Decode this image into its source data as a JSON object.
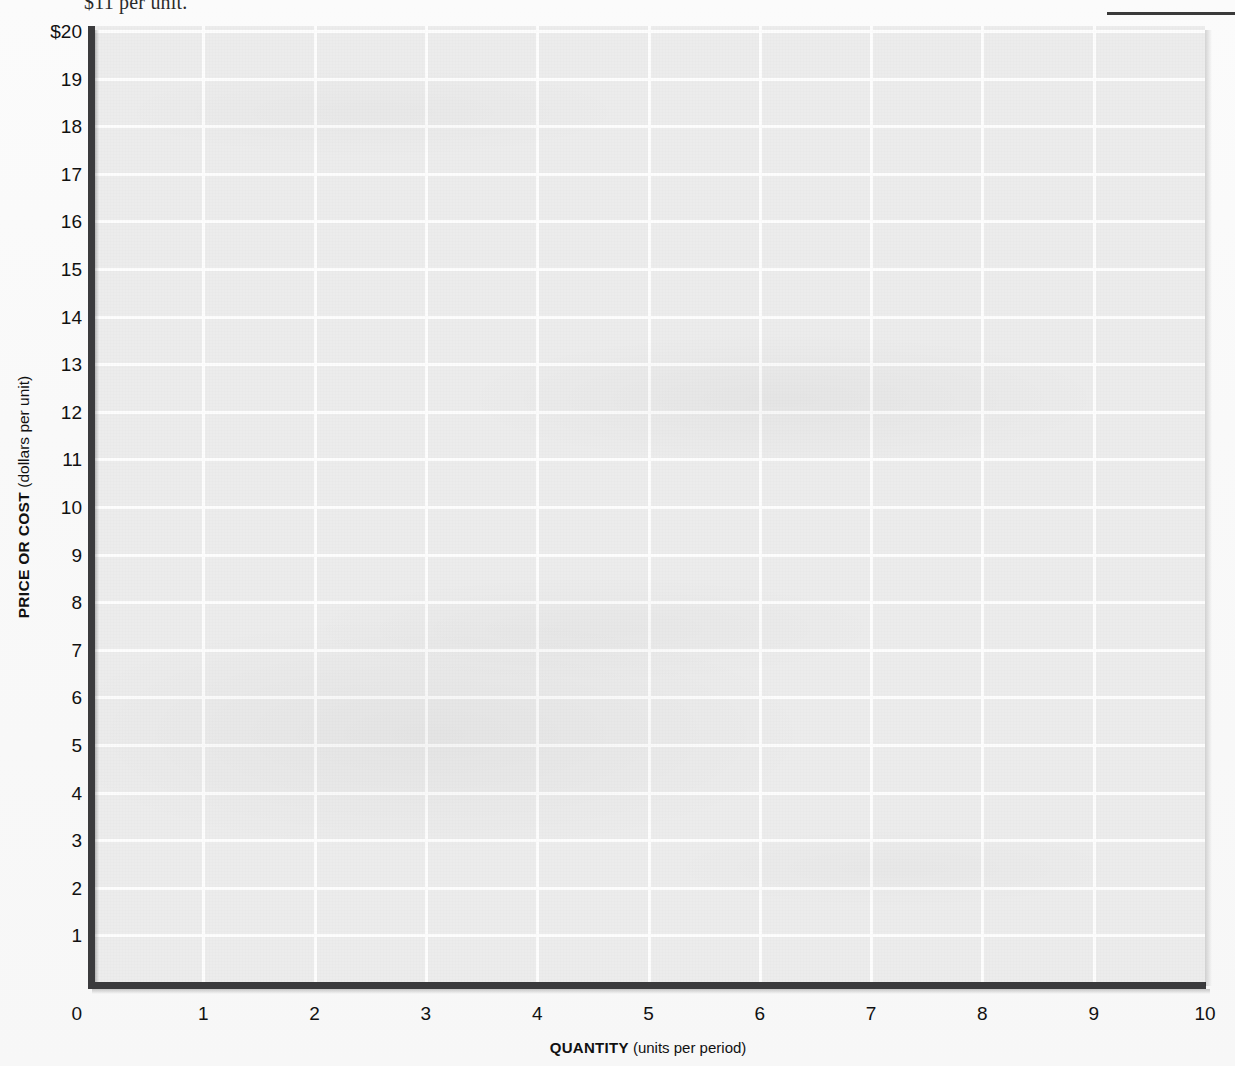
{
  "page": {
    "top_caption": "$11 per unit.",
    "top_rule": "horizontal-rule"
  },
  "chart_data": {
    "type": "line",
    "title": "",
    "subtitle": "",
    "xlabel_bold": "QUANTITY",
    "xlabel_light": "(units per period)",
    "ylabel_bold": "PRICE OR COST",
    "ylabel_light": "(dollars per unit)",
    "xlim": [
      0,
      10
    ],
    "ylim": [
      0,
      20
    ],
    "xticks": [
      "0",
      "1",
      "2",
      "3",
      "4",
      "5",
      "6",
      "7",
      "8",
      "9",
      "10"
    ],
    "yticks": [
      "$20",
      "19",
      "18",
      "17",
      "16",
      "15",
      "14",
      "13",
      "12",
      "11",
      "10",
      "9",
      "8",
      "7",
      "6",
      "5",
      "4",
      "3",
      "2",
      "1",
      "0"
    ],
    "grid": true,
    "legend": null,
    "series": [],
    "annotations": [],
    "note": "Blank worksheet grid — no data plotted",
    "colors": {
      "panel_fill": "#ececec",
      "gridline": "#fdfdfd",
      "axis": "#3b3b3d",
      "text": "#111111"
    }
  }
}
